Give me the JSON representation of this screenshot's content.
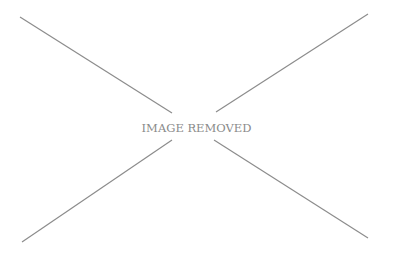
{
  "placeholder": {
    "label": "IMAGE REMOVED",
    "line_color": "#8c8c8c",
    "text_color": "#8a8a8a"
  }
}
